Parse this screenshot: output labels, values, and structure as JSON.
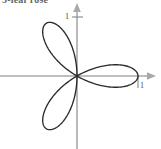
{
  "caption": {
    "text": "3-leaf rose"
  },
  "chart_data": {
    "type": "line",
    "title": "3-leaf rose",
    "subtitle": "",
    "xlabel": "",
    "ylabel": "",
    "equation": "r = cos(3θ)",
    "petal_count": 3,
    "petal_angles_deg": [
      0,
      120,
      240
    ],
    "petal_tip_radius": 1,
    "grid": false,
    "legend": null,
    "xlim": [
      -1.28,
      1.37
    ],
    "ylim": [
      -1.25,
      1.3
    ],
    "x_ticks": [
      {
        "value": 1,
        "label": "1"
      }
    ],
    "y_ticks": [
      {
        "value": 1,
        "label": "1"
      }
    ],
    "axes": {
      "x_arrow": true,
      "y_arrow": true,
      "color": "#a9a9a9"
    },
    "curve_color": "#2b2b2b",
    "theta_range_deg": [
      0,
      360
    ],
    "samples": 720,
    "points_polar": [
      {
        "theta_deg": 0,
        "r": 1.0
      },
      {
        "theta_deg": 15,
        "r": 0.707
      },
      {
        "theta_deg": 30,
        "r": 0.0
      },
      {
        "theta_deg": 45,
        "r": -0.707
      },
      {
        "theta_deg": 60,
        "r": -1.0
      },
      {
        "theta_deg": 75,
        "r": -0.707
      },
      {
        "theta_deg": 90,
        "r": 0.0
      },
      {
        "theta_deg": 105,
        "r": 0.707
      },
      {
        "theta_deg": 120,
        "r": 1.0
      },
      {
        "theta_deg": 135,
        "r": 0.707
      },
      {
        "theta_deg": 150,
        "r": 0.0
      },
      {
        "theta_deg": 165,
        "r": -0.707
      },
      {
        "theta_deg": 180,
        "r": -1.0
      },
      {
        "theta_deg": 195,
        "r": -0.707
      },
      {
        "theta_deg": 210,
        "r": 0.0
      },
      {
        "theta_deg": 225,
        "r": 0.707
      },
      {
        "theta_deg": 240,
        "r": 1.0
      },
      {
        "theta_deg": 255,
        "r": 0.707
      },
      {
        "theta_deg": 270,
        "r": 0.0
      },
      {
        "theta_deg": 285,
        "r": -0.707
      },
      {
        "theta_deg": 300,
        "r": -1.0
      },
      {
        "theta_deg": 315,
        "r": -0.707
      },
      {
        "theta_deg": 330,
        "r": 0.0
      },
      {
        "theta_deg": 345,
        "r": 0.707
      },
      {
        "theta_deg": 360,
        "r": 1.0
      }
    ],
    "geometry_px": {
      "origin_x": 77,
      "origin_y": 76,
      "unit_px": 61,
      "rotation_deg": 0
    }
  }
}
